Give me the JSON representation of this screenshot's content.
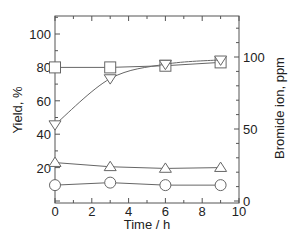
{
  "chart_data": {
    "type": "line",
    "title": "",
    "xlabel": "Time / h",
    "ylabel": "Yield, %",
    "y2label": "Bromide ion, ppm",
    "xlim": [
      0,
      10
    ],
    "ylim": [
      0,
      111
    ],
    "y2lim": [
      0,
      128
    ],
    "x_ticks": [
      0,
      2,
      4,
      6,
      8,
      10
    ],
    "y_ticks": [
      20,
      40,
      60,
      80,
      100
    ],
    "y2_ticks": [
      0,
      50,
      100
    ],
    "grid": false,
    "legend": "none",
    "x": [
      0,
      3,
      6,
      9
    ],
    "series": [
      {
        "name": "square",
        "marker": "square-open",
        "axis": "left",
        "values": [
          80,
          80,
          81,
          83
        ]
      },
      {
        "name": "triangle-down",
        "marker": "triangle-down-open",
        "axis": "right",
        "values": [
          53,
          85,
          95,
          98
        ],
        "smooth": true
      },
      {
        "name": "triangle-up",
        "marker": "triangle-up-open",
        "axis": "left",
        "values": [
          23,
          20.5,
          19.5,
          20
        ]
      },
      {
        "name": "circle",
        "marker": "circle-open",
        "axis": "left",
        "values": [
          9.5,
          11,
          9.5,
          9.5
        ]
      }
    ]
  }
}
